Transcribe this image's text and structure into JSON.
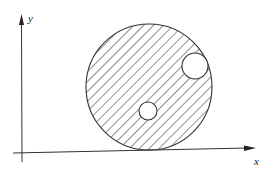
{
  "diagram": {
    "axes": {
      "x_label": "x",
      "y_label": "y"
    },
    "region": {
      "outer_circle": {
        "cx": 149,
        "cy": 87,
        "r": 63
      },
      "holes": [
        {
          "name": "upper-right-hole",
          "cx": 195,
          "cy": 66,
          "r": 13
        },
        {
          "name": "lower-hole",
          "cx": 148,
          "cy": 111,
          "r": 9
        }
      ],
      "fill": "diagonal-hatching"
    },
    "colors": {
      "stroke": "#333333",
      "background": "#ffffff"
    }
  }
}
